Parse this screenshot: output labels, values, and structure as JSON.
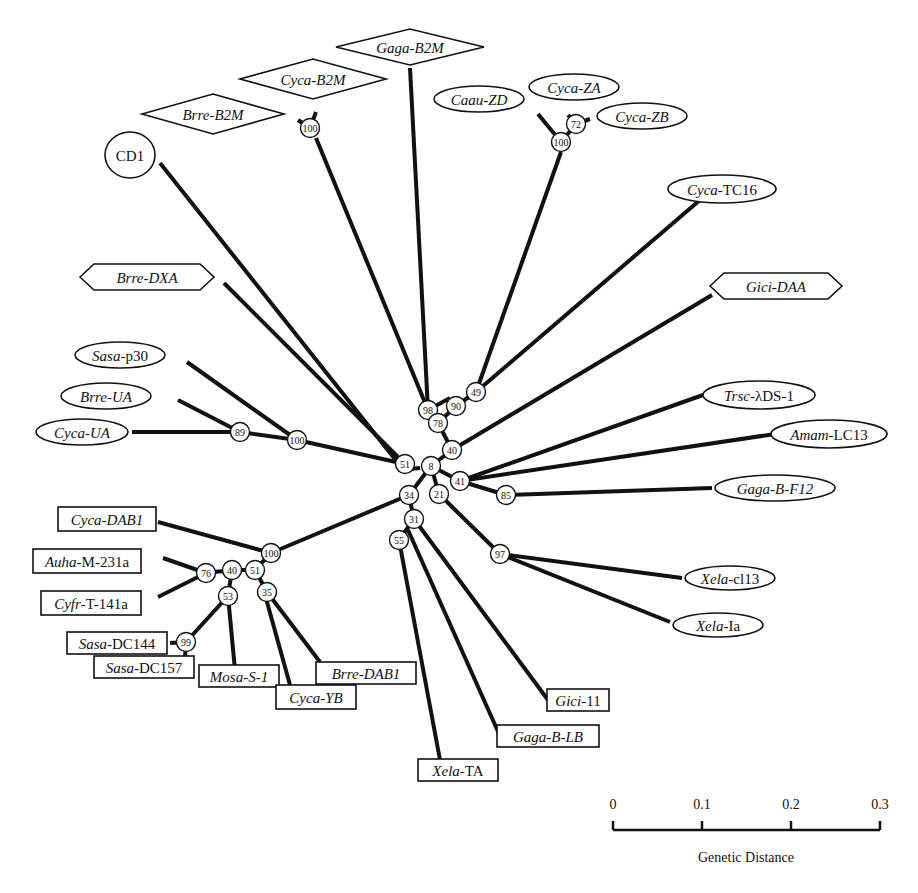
{
  "figure": {
    "type": "unrooted phylogenetic tree",
    "scale_bar": {
      "label": "Genetic Distance",
      "ticks": [
        "0",
        "0.1",
        "0.2",
        "0.3"
      ],
      "x0": 613,
      "x1": 880,
      "y": 830
    }
  },
  "nodes": [
    {
      "id": "n100_b2m",
      "label": "100",
      "x": 310,
      "y": 128
    },
    {
      "id": "n98",
      "label": "98",
      "x": 428,
      "y": 410
    },
    {
      "id": "n100_z",
      "label": "100",
      "x": 561,
      "y": 142
    },
    {
      "id": "n72",
      "label": "72",
      "x": 576,
      "y": 124
    },
    {
      "id": "n49",
      "label": "49",
      "x": 476,
      "y": 392
    },
    {
      "id": "n90",
      "label": "90",
      "x": 456,
      "y": 406
    },
    {
      "id": "n78",
      "label": "78",
      "x": 438,
      "y": 423
    },
    {
      "id": "n40",
      "label": "40",
      "x": 452,
      "y": 450
    },
    {
      "id": "n8",
      "label": "8",
      "x": 431,
      "y": 466
    },
    {
      "id": "n51a",
      "label": "51",
      "x": 405,
      "y": 464
    },
    {
      "id": "n100_ua",
      "label": "100",
      "x": 297,
      "y": 440
    },
    {
      "id": "n89",
      "label": "89",
      "x": 240,
      "y": 432
    },
    {
      "id": "n41",
      "label": "41",
      "x": 460,
      "y": 481
    },
    {
      "id": "n85",
      "label": "85",
      "x": 506,
      "y": 495
    },
    {
      "id": "n21",
      "label": "21",
      "x": 439,
      "y": 494
    },
    {
      "id": "n97",
      "label": "97",
      "x": 500,
      "y": 554
    },
    {
      "id": "n34",
      "label": "34",
      "x": 409,
      "y": 495
    },
    {
      "id": "n31",
      "label": "31",
      "x": 414,
      "y": 519
    },
    {
      "id": "n55",
      "label": "55",
      "x": 399,
      "y": 540
    },
    {
      "id": "n100_dab",
      "label": "100",
      "x": 271,
      "y": 553
    },
    {
      "id": "n51b",
      "label": "51",
      "x": 255,
      "y": 570
    },
    {
      "id": "n40b",
      "label": "40",
      "x": 232,
      "y": 570
    },
    {
      "id": "n76",
      "label": "76",
      "x": 206,
      "y": 573
    },
    {
      "id": "n35",
      "label": "35",
      "x": 267,
      "y": 592
    },
    {
      "id": "n53",
      "label": "53",
      "x": 228,
      "y": 596
    },
    {
      "id": "n99",
      "label": "99",
      "x": 186,
      "y": 642
    }
  ],
  "leaves": [
    {
      "id": "cd1",
      "genus": "",
      "rest": "CD1",
      "shape": "circle",
      "x": 130,
      "y": 155,
      "w": 50,
      "h": 46
    },
    {
      "id": "brre_b2m",
      "genus": "Brre-B2M",
      "rest": "",
      "shape": "diamond",
      "x": 213,
      "y": 114,
      "w": 142,
      "h": 40
    },
    {
      "id": "cyca_b2m",
      "genus": "Cyca-B2M",
      "rest": "",
      "shape": "diamond",
      "x": 313,
      "y": 79,
      "w": 146,
      "h": 40
    },
    {
      "id": "gaga_b2m",
      "genus": "Gaga-B2M",
      "rest": "",
      "shape": "diamond",
      "x": 410,
      "y": 47,
      "w": 148,
      "h": 36
    },
    {
      "id": "caau_zd",
      "genus": "Caau-ZD",
      "rest": "",
      "shape": "ellipse",
      "x": 479,
      "y": 99,
      "w": 90,
      "h": 26
    },
    {
      "id": "cyca_za",
      "genus": "Cyca-ZA",
      "rest": "",
      "shape": "ellipse",
      "x": 574,
      "y": 87,
      "w": 90,
      "h": 26
    },
    {
      "id": "cyca_zb",
      "genus": "Cyca-ZB",
      "rest": "",
      "shape": "ellipse",
      "x": 642,
      "y": 116,
      "w": 90,
      "h": 26
    },
    {
      "id": "cyca_tc16",
      "genus": "Cyca",
      "rest": "-TC16",
      "shape": "ellipse",
      "x": 722,
      "y": 189,
      "w": 108,
      "h": 28
    },
    {
      "id": "gici_daa",
      "genus": "Gici-DAA",
      "rest": "",
      "shape": "hexagon",
      "x": 776,
      "y": 286,
      "w": 132,
      "h": 26
    },
    {
      "id": "brre_dxa",
      "genus": "Brre-DXA",
      "rest": "",
      "shape": "hexagon",
      "x": 147,
      "y": 277,
      "w": 134,
      "h": 26
    },
    {
      "id": "sasa_p30",
      "genus": "Sasa",
      "rest": "-p30",
      "shape": "ellipse",
      "x": 120,
      "y": 355,
      "w": 90,
      "h": 26
    },
    {
      "id": "brre_ua",
      "genus": "Brre-UA",
      "rest": "",
      "shape": "ellipse",
      "x": 106,
      "y": 396,
      "w": 90,
      "h": 26
    },
    {
      "id": "cyca_ua",
      "genus": "Cyca-UA",
      "rest": "",
      "shape": "ellipse",
      "x": 82,
      "y": 432,
      "w": 92,
      "h": 26
    },
    {
      "id": "trsc_lds1",
      "genus": "Trsc",
      "rest": "-λDS-1",
      "shape": "ellipse",
      "x": 759,
      "y": 395,
      "w": 112,
      "h": 28
    },
    {
      "id": "amam_lc13",
      "genus": "Amam",
      "rest": "-LC13",
      "shape": "ellipse",
      "x": 829,
      "y": 434,
      "w": 116,
      "h": 28
    },
    {
      "id": "gaga_bf12",
      "genus": "Gaga-B-F12",
      "rest": "",
      "shape": "ellipse",
      "x": 775,
      "y": 488,
      "w": 120,
      "h": 26
    },
    {
      "id": "xela_cl13",
      "genus": "Xela",
      "rest": "-cl13",
      "shape": "ellipse",
      "x": 730,
      "y": 578,
      "w": 90,
      "h": 24
    },
    {
      "id": "xela_ia",
      "genus": "Xela",
      "rest": "-Ia",
      "shape": "ellipse",
      "x": 718,
      "y": 625,
      "w": 90,
      "h": 24
    },
    {
      "id": "cyca_dab1",
      "genus": "Cyca-DAB1",
      "rest": "",
      "shape": "rect",
      "x": 107,
      "y": 519,
      "w": 98,
      "h": 24
    },
    {
      "id": "auha_m231a",
      "genus": "Auha",
      "rest": "-M-231a",
      "shape": "rect",
      "x": 87,
      "y": 561,
      "w": 108,
      "h": 24
    },
    {
      "id": "cyfr_t141a",
      "genus": "Cyfr",
      "rest": "-T-141a",
      "shape": "rect",
      "x": 91,
      "y": 603,
      "w": 100,
      "h": 24
    },
    {
      "id": "sasa_dc144",
      "genus": "Sasa",
      "rest": "-DC144",
      "shape": "rect",
      "x": 117,
      "y": 643,
      "w": 100,
      "h": 22
    },
    {
      "id": "sasa_dc157",
      "genus": "Sasa",
      "rest": "-DC157",
      "shape": "rect",
      "x": 144,
      "y": 667,
      "w": 100,
      "h": 22
    },
    {
      "id": "mosa_s1",
      "genus": "Mosa-S-1",
      "rest": "",
      "shape": "rect",
      "x": 239,
      "y": 676,
      "w": 80,
      "h": 22
    },
    {
      "id": "cyca_yb",
      "genus": "Cyca-YB",
      "rest": "",
      "shape": "rect",
      "x": 316,
      "y": 697,
      "w": 80,
      "h": 24
    },
    {
      "id": "brre_dab1",
      "genus": "Brre-DAB1",
      "rest": "",
      "shape": "rect",
      "x": 366,
      "y": 673,
      "w": 100,
      "h": 22
    },
    {
      "id": "xela_ta",
      "genus": "Xela",
      "rest": "-TA",
      "shape": "rect",
      "x": 458,
      "y": 770,
      "w": 80,
      "h": 22
    },
    {
      "id": "gaga_blb",
      "genus": "Gaga-B-LB",
      "rest": "",
      "shape": "rect",
      "x": 548,
      "y": 736,
      "w": 102,
      "h": 22
    },
    {
      "id": "gici_11",
      "genus": "Gici",
      "rest": "-11",
      "shape": "rect",
      "x": 578,
      "y": 700,
      "w": 62,
      "h": 22
    }
  ],
  "edges": [
    [
      398,
      470,
      420,
      468
    ],
    [
      160,
      163,
      398,
      463
    ],
    [
      310,
      128,
      298,
      120
    ],
    [
      310,
      128,
      316,
      112
    ],
    [
      316,
      138,
      428,
      410
    ],
    [
      410,
      68,
      428,
      410
    ],
    [
      428,
      410,
      450,
      398
    ],
    [
      561,
      142,
      538,
      114
    ],
    [
      561,
      142,
      576,
      124
    ],
    [
      576,
      124,
      568,
      115
    ],
    [
      576,
      124,
      590,
      119
    ],
    [
      561,
      152,
      476,
      392
    ],
    [
      700,
      200,
      476,
      392
    ],
    [
      476,
      392,
      456,
      406
    ],
    [
      456,
      406,
      438,
      423
    ],
    [
      438,
      423,
      452,
      450
    ],
    [
      224,
      283,
      405,
      464
    ],
    [
      712,
      295,
      452,
      450
    ],
    [
      452,
      450,
      431,
      466
    ],
    [
      187,
      362,
      297,
      440
    ],
    [
      178,
      400,
      240,
      432
    ],
    [
      132,
      432,
      240,
      432
    ],
    [
      240,
      432,
      297,
      440
    ],
    [
      297,
      440,
      405,
      464
    ],
    [
      431,
      466,
      460,
      481
    ],
    [
      431,
      466,
      439,
      494
    ],
    [
      431,
      466,
      409,
      495
    ],
    [
      703,
      395,
      460,
      481
    ],
    [
      775,
      434,
      460,
      481
    ],
    [
      460,
      481,
      506,
      495
    ],
    [
      506,
      495,
      712,
      488
    ],
    [
      506,
      495,
      514,
      492
    ],
    [
      439,
      494,
      500,
      554
    ],
    [
      500,
      554,
      682,
      578
    ],
    [
      500,
      554,
      670,
      622
    ],
    [
      409,
      495,
      271,
      553
    ],
    [
      409,
      495,
      414,
      519
    ],
    [
      414,
      519,
      399,
      540
    ],
    [
      414,
      519,
      548,
      700
    ],
    [
      408,
      530,
      500,
      736
    ],
    [
      399,
      540,
      440,
      760
    ],
    [
      158,
      522,
      271,
      553
    ],
    [
      271,
      553,
      255,
      570
    ],
    [
      255,
      570,
      232,
      570
    ],
    [
      232,
      570,
      206,
      573
    ],
    [
      163,
      558,
      206,
      573
    ],
    [
      158,
      597,
      206,
      573
    ],
    [
      232,
      570,
      228,
      596
    ],
    [
      228,
      596,
      186,
      642
    ],
    [
      228,
      596,
      235,
      670
    ],
    [
      255,
      570,
      267,
      592
    ],
    [
      262,
      584,
      290,
      685
    ],
    [
      267,
      592,
      320,
      662
    ],
    [
      170,
      643,
      186,
      642
    ],
    [
      186,
      642,
      185,
      658
    ]
  ]
}
